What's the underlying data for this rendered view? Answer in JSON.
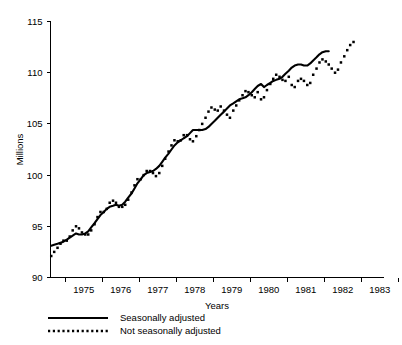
{
  "chart_data": {
    "type": "line",
    "title": "",
    "xlabel": "Years",
    "ylabel": "Millions",
    "ylim": [
      90,
      115
    ],
    "yticks": [
      90,
      95,
      100,
      105,
      110,
      115
    ],
    "ytick_labels": [
      "90",
      "95",
      "100",
      "105",
      "110",
      "115"
    ],
    "xlim": [
      1974.6,
      1983.6
    ],
    "xticks": [
      1975,
      1976,
      1977,
      1978,
      1979,
      1980,
      1981,
      1982,
      1983,
      1984
    ],
    "xtick_labels": [
      "1975",
      "1976",
      "1977",
      "1978",
      "1979",
      "1980",
      "1981",
      "1982",
      "1983"
    ],
    "grid": false,
    "legend_position": "below-axes-left",
    "series": [
      {
        "name": "Seasonally adjusted",
        "style": "solid",
        "x": [
          1974.62,
          1974.7,
          1974.79,
          1974.87,
          1974.95,
          1975.04,
          1975.12,
          1975.2,
          1975.29,
          1975.37,
          1975.45,
          1975.54,
          1975.62,
          1975.7,
          1975.79,
          1975.87,
          1975.95,
          1976.04,
          1976.12,
          1976.2,
          1976.29,
          1976.37,
          1976.45,
          1976.54,
          1976.62,
          1976.7,
          1976.79,
          1976.87,
          1976.95,
          1977.04,
          1977.12,
          1977.2,
          1977.29,
          1977.37,
          1977.45,
          1977.54,
          1977.62,
          1977.7,
          1977.79,
          1977.87,
          1977.95,
          1978.04,
          1978.12,
          1978.2,
          1978.29,
          1978.37,
          1978.45,
          1978.54,
          1978.62,
          1978.7,
          1978.79,
          1978.87,
          1978.95,
          1979.04,
          1979.12,
          1979.2,
          1979.29,
          1979.37,
          1979.45,
          1979.54,
          1979.62,
          1979.7,
          1979.79,
          1979.87,
          1979.95,
          1980.04,
          1980.12,
          1980.2,
          1980.29,
          1980.37,
          1980.45,
          1980.54,
          1980.62,
          1980.7,
          1980.79,
          1980.87,
          1980.95,
          1981.04,
          1981.12,
          1981.2,
          1981.29,
          1981.37,
          1981.45,
          1981.54,
          1981.62,
          1981.7,
          1981.79,
          1981.87,
          1981.95,
          1982.04,
          1982.12,
          1982.2,
          1982.29,
          1982.37,
          1982.45,
          1982.54,
          1982.62,
          1982.7,
          1982.79,
          1982.87,
          1982.95,
          1983.04,
          1983.12,
          1983.2,
          1983.29,
          1983.37,
          1983.45,
          1983.54
        ],
        "values": [
          93.1,
          93.2,
          93.3,
          93.4,
          93.5,
          93.7,
          93.9,
          94.1,
          94.3,
          94.2,
          94.2,
          94.3,
          94.5,
          94.9,
          95.3,
          95.7,
          96.1,
          96.4,
          96.7,
          96.9,
          97.0,
          97.1,
          97.0,
          97.1,
          97.4,
          97.8,
          98.2,
          98.7,
          99.2,
          99.6,
          100.0,
          100.2,
          100.3,
          100.4,
          100.6,
          100.9,
          101.3,
          101.7,
          102.1,
          102.5,
          102.9,
          103.2,
          103.4,
          103.6,
          103.8,
          104.1,
          104.4,
          104.4,
          104.4,
          104.4,
          104.5,
          104.7,
          105.0,
          105.3,
          105.6,
          105.9,
          106.2,
          106.5,
          106.8,
          107.0,
          107.2,
          107.4,
          107.5,
          107.6,
          107.8,
          108.1,
          108.4,
          108.7,
          108.9,
          108.6,
          108.8,
          109.0,
          109.2,
          109.3,
          109.4,
          109.6,
          109.9,
          110.2,
          110.5,
          110.7,
          110.8,
          110.8,
          110.7,
          110.7,
          110.9,
          111.2,
          111.5,
          111.8,
          112.0,
          112.1,
          112.1,
          112.1,
          112.1,
          112.1,
          112.1,
          112.1,
          112.1,
          112.1,
          112.1,
          112.1,
          112.1,
          112.1,
          112.1,
          112.1,
          112.1,
          112.1,
          112.1,
          112.1
        ]
      },
      {
        "name": "Not seasonally adjusted",
        "style": "dotted",
        "x": [
          1974.62,
          1974.7,
          1974.79,
          1974.87,
          1974.95,
          1975.04,
          1975.12,
          1975.2,
          1975.29,
          1975.37,
          1975.45,
          1975.54,
          1975.62,
          1975.7,
          1975.79,
          1975.87,
          1975.95,
          1976.04,
          1976.12,
          1976.2,
          1976.29,
          1976.37,
          1976.45,
          1976.54,
          1976.62,
          1976.7,
          1976.79,
          1976.87,
          1976.95,
          1977.04,
          1977.12,
          1977.2,
          1977.29,
          1977.37,
          1977.45,
          1977.54,
          1977.62,
          1977.7,
          1977.79,
          1977.87,
          1977.95,
          1978.04,
          1978.12,
          1978.2,
          1978.29,
          1978.37,
          1978.45,
          1978.54,
          1978.62,
          1978.7,
          1978.79,
          1978.87,
          1978.95,
          1979.04,
          1979.12,
          1979.2,
          1979.29,
          1979.37,
          1979.45,
          1979.54,
          1979.62,
          1979.7,
          1979.79,
          1979.87,
          1979.95,
          1980.04,
          1980.12,
          1980.2,
          1980.29,
          1980.37,
          1980.45,
          1980.54,
          1980.62,
          1980.7,
          1980.79,
          1980.87,
          1980.95,
          1981.04,
          1981.12,
          1981.2,
          1981.29,
          1981.37,
          1981.45,
          1981.54,
          1981.62,
          1981.7,
          1981.79,
          1981.87,
          1981.95,
          1982.04,
          1982.12,
          1982.2,
          1982.29,
          1982.37,
          1982.45,
          1982.54,
          1982.62,
          1982.7,
          1982.79,
          1982.87,
          1982.95,
          1983.04,
          1983.12,
          1983.2,
          1983.29,
          1983.37,
          1983.45,
          1983.54
        ],
        "values": [
          92.1,
          92.5,
          92.9,
          93.3,
          93.6,
          93.6,
          94.0,
          94.6,
          95.0,
          94.8,
          94.4,
          94.2,
          94.2,
          94.6,
          95.2,
          95.9,
          96.4,
          96.4,
          96.7,
          97.3,
          97.5,
          97.3,
          96.9,
          96.9,
          97.1,
          97.6,
          98.3,
          99.0,
          99.6,
          99.6,
          100.0,
          100.4,
          100.4,
          100.2,
          99.9,
          100.2,
          100.9,
          101.6,
          102.3,
          102.9,
          103.4,
          103.3,
          103.4,
          103.9,
          103.9,
          103.5,
          103.3,
          103.8,
          104.4,
          105.0,
          105.6,
          106.2,
          106.6,
          106.4,
          106.3,
          106.7,
          106.3,
          105.9,
          105.6,
          106.3,
          106.8,
          107.3,
          107.8,
          108.2,
          108.1,
          107.8,
          107.6,
          108.1,
          107.4,
          107.6,
          108.3,
          108.9,
          109.4,
          109.8,
          109.6,
          109.3,
          109.2,
          109.6,
          108.8,
          108.6,
          109.2,
          109.4,
          109.2,
          108.8,
          109.0,
          109.8,
          110.4,
          111.0,
          111.3,
          111.1,
          110.8,
          110.4,
          110.0,
          110.3,
          111.0,
          111.6,
          112.2,
          112.7,
          113.0,
          112.6,
          112.2,
          112.1,
          112.1,
          112.1,
          112.1,
          112.1,
          112.1,
          112.1
        ]
      }
    ]
  },
  "legend": {
    "items": [
      {
        "label": "Seasonally adjusted",
        "style": "solid"
      },
      {
        "label": "Not seasonally adjusted",
        "style": "dotted"
      }
    ]
  }
}
